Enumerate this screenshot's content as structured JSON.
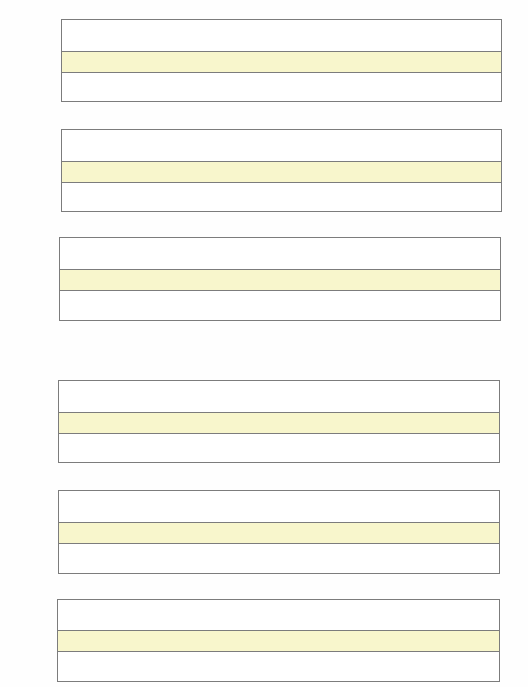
{
  "page": {
    "type": "handwriting-practice-worksheet",
    "background_color": "#ffffff",
    "line_color": "#7c7c7c",
    "band_color": "#f8f6cc"
  },
  "writing_boxes": [
    {
      "index": 1,
      "left": 61,
      "top": 19,
      "width": 441,
      "height": 83,
      "band_top": 31,
      "band_height": 22,
      "text": ""
    },
    {
      "index": 2,
      "left": 61,
      "top": 129,
      "width": 441,
      "height": 83,
      "band_top": 31,
      "band_height": 22,
      "text": ""
    },
    {
      "index": 3,
      "left": 59,
      "top": 237,
      "width": 442,
      "height": 84,
      "band_top": 31,
      "band_height": 22,
      "text": ""
    },
    {
      "index": 4,
      "left": 58,
      "top": 380,
      "width": 442,
      "height": 83,
      "band_top": 31,
      "band_height": 22,
      "text": ""
    },
    {
      "index": 5,
      "left": 58,
      "top": 490,
      "width": 442,
      "height": 84,
      "band_top": 31,
      "band_height": 22,
      "text": ""
    },
    {
      "index": 6,
      "left": 57,
      "top": 599,
      "width": 443,
      "height": 83,
      "band_top": 30,
      "band_height": 22,
      "text": ""
    }
  ]
}
